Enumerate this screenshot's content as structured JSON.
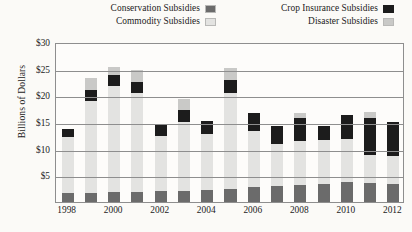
{
  "legend": {
    "columns": [
      {
        "entries": [
          {
            "label": "Conservation Subsidies",
            "color": "#6b6b6b",
            "key": "conservation"
          },
          {
            "label": "Commodity Subsidies",
            "color": "#e3e3e1",
            "key": "commodity"
          }
        ]
      },
      {
        "entries": [
          {
            "label": "Crop Insurance Subsidies",
            "color": "#1c1c1c",
            "key": "crop_insurance"
          },
          {
            "label": "Disaster Subsidies",
            "color": "#c9c9c7",
            "key": "disaster"
          }
        ]
      }
    ]
  },
  "axis": {
    "ylabel": "Billions of Dollars",
    "yticks": [
      "$5",
      "$10",
      "$15",
      "$20",
      "$25",
      "$30"
    ],
    "xticks": [
      "1998",
      "2000",
      "2002",
      "2004",
      "2006",
      "2008",
      "2010",
      "2012"
    ]
  },
  "chart_data": {
    "type": "bar",
    "stacked": true,
    "title": "",
    "xlabel": "",
    "ylabel": "Billions of Dollars",
    "ylim": [
      0,
      30
    ],
    "ytick_values": [
      5,
      10,
      15,
      20,
      25,
      30
    ],
    "grid": true,
    "legend_position": "top",
    "categories": [
      "1998",
      "1999",
      "2000",
      "2001",
      "2002",
      "2003",
      "2004",
      "2005",
      "2006",
      "2007",
      "2008",
      "2009",
      "2010",
      "2011",
      "2012"
    ],
    "xtick_labels": [
      "1998",
      "2000",
      "2002",
      "2004",
      "2006",
      "2008",
      "2010",
      "2012"
    ],
    "series": [
      {
        "name": "Conservation Subsidies",
        "color": "#6b6b6b",
        "values": [
          1.6,
          1.7,
          1.8,
          1.8,
          2.0,
          2.1,
          2.2,
          2.4,
          2.8,
          3.0,
          3.2,
          3.4,
          3.7,
          3.5,
          3.4
        ]
      },
      {
        "name": "Commodity Subsidies",
        "color": "#e3e3e1",
        "values": [
          10.5,
          17.3,
          20.0,
          18.6,
          10.3,
          12.9,
          10.5,
          18.1,
          10.6,
          7.9,
          8.3,
          8.2,
          8.2,
          5.4,
          5.3
        ]
      },
      {
        "name": "Crop Insurance Subsidies",
        "color": "#1c1c1c",
        "values": [
          1.5,
          2.0,
          2.0,
          2.1,
          2.4,
          2.3,
          2.5,
          2.3,
          3.2,
          3.4,
          4.2,
          2.7,
          4.4,
          6.8,
          6.3
        ]
      },
      {
        "name": "Disaster Subsidies",
        "color": "#c9c9c7",
        "values": [
          0.0,
          2.2,
          1.6,
          2.3,
          0.0,
          2.1,
          0.0,
          2.4,
          0.0,
          0.0,
          1.0,
          0.0,
          0.0,
          1.1,
          0.0
        ]
      }
    ],
    "totals": [
      13.6,
      23.2,
      25.4,
      24.8,
      14.7,
      19.4,
      15.2,
      25.2,
      16.6,
      14.3,
      16.7,
      14.3,
      16.3,
      16.8,
      15.0
    ]
  }
}
